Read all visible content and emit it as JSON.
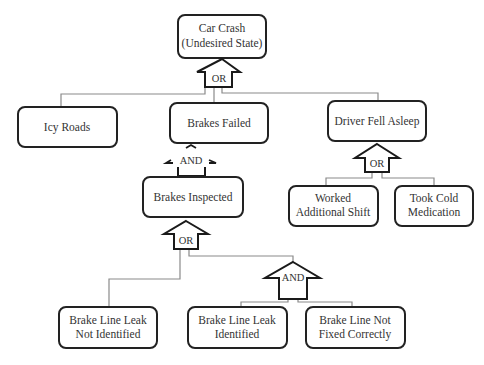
{
  "diagram": {
    "type": "fault-tree",
    "colors": {
      "box_stroke": "#222222",
      "connector": "#8a8a8a",
      "text": "#333333",
      "background": "#ffffff"
    },
    "nodes": {
      "car_crash": {
        "line1": "Car Crash",
        "line2": "(Undesired State)"
      },
      "icy_roads": {
        "label": "Icy Roads"
      },
      "brakes_failed": {
        "label": "Brakes Failed"
      },
      "driver_fell_asleep": {
        "label": "Driver Fell Asleep"
      },
      "brakes_inspected": {
        "label": "Brakes Inspected"
      },
      "worked_additional_shift": {
        "line1": "Worked",
        "line2": "Additional Shift"
      },
      "took_cold_medication": {
        "line1": "Took Cold",
        "line2": "Medication"
      },
      "brake_line_leak_not_identified": {
        "line1": "Brake Line Leak",
        "line2": "Not Identified"
      },
      "brake_line_leak_identified": {
        "line1": "Brake Line Leak",
        "line2": "Identified"
      },
      "brake_line_not_fixed_correctly": {
        "line1": "Brake Line Not",
        "line2": "Fixed Correctly"
      }
    },
    "gates": {
      "top_or": {
        "label": "OR"
      },
      "brakes_failed_and": {
        "label": "AND"
      },
      "driver_or": {
        "label": "OR"
      },
      "inspected_or": {
        "label": "OR"
      },
      "lower_and": {
        "label": "AND"
      }
    }
  }
}
